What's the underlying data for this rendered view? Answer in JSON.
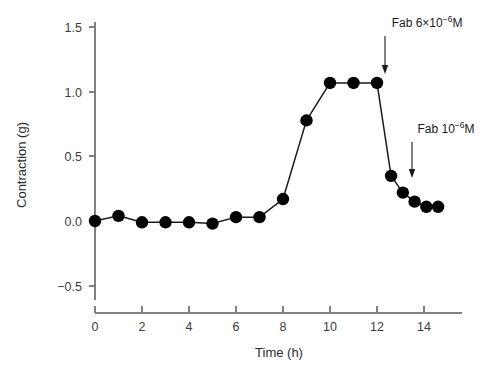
{
  "chart_data": {
    "type": "line",
    "title": "",
    "xlabel": "Time (h)",
    "ylabel": "Contraction (g)",
    "xlim": [
      -0.45,
      15.0
    ],
    "ylim": [
      -0.72,
      1.62
    ],
    "xticks": [
      0,
      2,
      4,
      6,
      8,
      10,
      12,
      14
    ],
    "xtick_labels": [
      "0",
      "2",
      "4",
      "6",
      "8",
      "10",
      "12",
      "14"
    ],
    "yticks": [
      -0.5,
      0.0,
      0.5,
      1.0,
      1.5
    ],
    "ytick_labels": [
      "−0.5",
      "0.0",
      "0.5",
      "1.0",
      "1.5"
    ],
    "grid": false,
    "legend": "none",
    "marker": "filled-circle",
    "marker_color": "#000000",
    "line_color": "#1a1a1a",
    "axis_color": "#808080",
    "x": [
      0,
      1,
      2,
      3,
      4,
      5,
      6,
      7,
      8,
      9,
      10,
      11,
      12,
      12.6,
      13.1,
      13.6,
      14.1,
      14.6
    ],
    "y": [
      0.0,
      0.04,
      -0.01,
      -0.01,
      -0.01,
      -0.02,
      0.03,
      0.03,
      0.17,
      0.78,
      1.07,
      1.07,
      1.07,
      0.35,
      0.22,
      0.15,
      0.11,
      0.11
    ],
    "series": [
      {
        "name": "Contraction",
        "values": [
          0.0,
          0.04,
          -0.01,
          -0.01,
          -0.01,
          -0.02,
          0.03,
          0.03,
          0.17,
          0.78,
          1.07,
          1.07,
          1.07,
          0.35,
          0.22,
          0.15,
          0.11,
          0.11
        ]
      }
    ],
    "annotations": [
      {
        "id": "fab-high-dose",
        "text_prefix": "Fab 6×10",
        "text_sup": "−6",
        "text_suffix": "M",
        "full_text": "Fab 6×10⁻⁶M",
        "points_to_x": 12,
        "points_to_y": 1.07
      },
      {
        "id": "fab-low-dose",
        "text_prefix": "Fab 10",
        "text_sup": "−6",
        "text_suffix": "M",
        "full_text": "Fab 10⁻⁶M",
        "points_to_x": 13.1,
        "points_to_y": 0.22
      }
    ]
  }
}
